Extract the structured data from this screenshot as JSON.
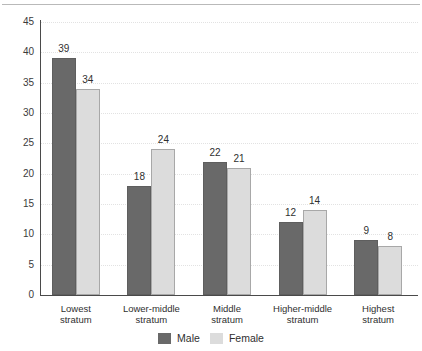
{
  "chart_data": {
    "type": "bar",
    "title": "",
    "subtitle": "",
    "xlabel": "",
    "ylabel": "",
    "ylim": [
      0,
      45
    ],
    "ytick_step": 5,
    "yticks": [
      0,
      5,
      10,
      15,
      20,
      25,
      30,
      35,
      40,
      45
    ],
    "grid": "horizontal-dotted",
    "legend_position": "bottom-center",
    "data_labels": true,
    "categories": [
      "Lowest stratum",
      "Lower-middle stratum",
      "Middle stratum",
      "Higher-middle stratum",
      "Highest stratum"
    ],
    "series": [
      {
        "name": "Male",
        "color": "#696969",
        "values": [
          39,
          18,
          22,
          12,
          9
        ]
      },
      {
        "name": "Female",
        "color": "#dcdcdc",
        "values": [
          34,
          24,
          21,
          14,
          8
        ]
      }
    ]
  },
  "legend": {
    "items": [
      {
        "label": "Male"
      },
      {
        "label": "Female"
      }
    ]
  },
  "colors": {
    "male": "#696969",
    "female": "#dcdcdc",
    "axis": "#4a4a4a",
    "grid": "#e2e2e2",
    "text": "#2f2f2f",
    "rule": "#b9b9b9"
  }
}
